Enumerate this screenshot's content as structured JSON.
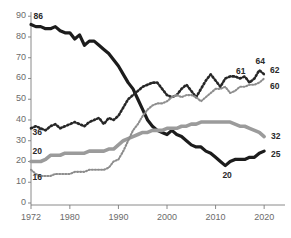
{
  "chart_data": {
    "type": "line",
    "title": "",
    "subtitle": "",
    "xlabel": "",
    "ylabel": "",
    "xlim": [
      1972,
      2021
    ],
    "ylim": [
      0,
      93
    ],
    "grid": false,
    "legend_position": "none",
    "x_ticks": [
      1972,
      1980,
      1990,
      2000,
      2010,
      2020
    ],
    "x_tick_labels": [
      "1972",
      "1980",
      "1990",
      "2000",
      "2010",
      "2020"
    ],
    "y_ticks": [
      0,
      10,
      20,
      30,
      40,
      50,
      60,
      70,
      80,
      90
    ],
    "y_tick_labels": [
      "0",
      "10",
      "20",
      "30",
      "40",
      "50",
      "60",
      "70",
      "80",
      "90"
    ],
    "series": [
      {
        "name": "series-dark-solid",
        "style": "solid",
        "color": "#1c1c1c",
        "width": 3.2,
        "start_label": "86",
        "end_label": "25",
        "annotation_label": "20",
        "x": [
          1972,
          1973,
          1974,
          1975,
          1976,
          1977,
          1978,
          1979,
          1980,
          1981,
          1982,
          1983,
          1984,
          1985,
          1986,
          1987,
          1988,
          1989,
          1990,
          1991,
          1992,
          1993,
          1994,
          1995,
          1996,
          1997,
          1998,
          1999,
          2000,
          2001,
          2002,
          2003,
          2004,
          2005,
          2006,
          2007,
          2008,
          2009,
          2010,
          2011,
          2012,
          2013,
          2014,
          2015,
          2016,
          2017,
          2018,
          2019,
          2020
        ],
        "values": [
          86,
          85,
          85,
          84,
          84,
          85,
          83,
          82,
          82,
          79,
          81,
          76,
          78,
          78,
          76,
          74,
          72,
          69,
          66,
          62,
          58,
          55,
          50,
          45,
          40,
          37,
          35,
          34,
          33,
          35,
          33,
          32,
          30,
          28,
          27,
          27,
          25,
          24,
          22,
          20,
          18,
          20,
          21,
          21,
          21,
          22,
          22,
          24,
          25
        ]
      },
      {
        "name": "series-gray-solid",
        "style": "solid",
        "color": "#9b9b9b",
        "width": 3.6,
        "start_label": "20",
        "end_label": "32",
        "x": [
          1972,
          1973,
          1974,
          1975,
          1976,
          1977,
          1978,
          1979,
          1980,
          1981,
          1982,
          1983,
          1984,
          1985,
          1986,
          1987,
          1988,
          1989,
          1990,
          1991,
          1992,
          1993,
          1994,
          1995,
          1996,
          1997,
          1998,
          1999,
          2000,
          2001,
          2002,
          2003,
          2004,
          2005,
          2006,
          2007,
          2008,
          2009,
          2010,
          2011,
          2012,
          2013,
          2014,
          2015,
          2016,
          2017,
          2018,
          2019,
          2020
        ],
        "values": [
          20,
          20,
          20,
          21,
          23,
          23,
          23,
          24,
          24,
          24,
          24,
          24,
          25,
          25,
          25,
          25,
          26,
          26,
          28,
          30,
          31,
          32,
          33,
          34,
          34,
          35,
          35,
          35,
          36,
          36,
          36,
          37,
          37,
          38,
          38,
          39,
          39,
          39,
          39,
          39,
          39,
          39,
          38,
          37,
          37,
          36,
          35,
          34,
          32
        ]
      },
      {
        "name": "series-dark-dotted",
        "style": "dotted",
        "color": "#272727",
        "width": 2.6,
        "start_label": "36",
        "end_label": "64",
        "mid_label": "61",
        "x": [
          1972,
          1973,
          1974,
          1975,
          1976,
          1977,
          1978,
          1979,
          1980,
          1981,
          1982,
          1983,
          1984,
          1985,
          1986,
          1987,
          1988,
          1989,
          1990,
          1991,
          1992,
          1993,
          1994,
          1995,
          1996,
          1997,
          1998,
          1999,
          2000,
          2001,
          2002,
          2003,
          2004,
          2005,
          2006,
          2007,
          2008,
          2009,
          2010,
          2011,
          2012,
          2013,
          2014,
          2015,
          2016,
          2017,
          2018,
          2019,
          2020
        ],
        "values": [
          36,
          37,
          36,
          35,
          37,
          38,
          36,
          37,
          38,
          39,
          38,
          37,
          39,
          40,
          41,
          38,
          41,
          40,
          42,
          46,
          50,
          52,
          54,
          56,
          57,
          58,
          58,
          55,
          52,
          51,
          52,
          55,
          57,
          54,
          51,
          55,
          59,
          62,
          59,
          56,
          60,
          61,
          61,
          60,
          61,
          58,
          60,
          64,
          62
        ]
      },
      {
        "name": "series-light-dotted",
        "style": "dotted",
        "color": "#8d8d8d",
        "width": 2.1,
        "start_label": "16",
        "end_label": "60",
        "x": [
          1972,
          1973,
          1974,
          1975,
          1976,
          1977,
          1978,
          1979,
          1980,
          1981,
          1982,
          1983,
          1984,
          1985,
          1986,
          1987,
          1988,
          1989,
          1990,
          1991,
          1992,
          1993,
          1994,
          1995,
          1996,
          1997,
          1998,
          1999,
          2000,
          2001,
          2002,
          2003,
          2004,
          2005,
          2006,
          2007,
          2008,
          2009,
          2010,
          2011,
          2012,
          2013,
          2014,
          2015,
          2016,
          2017,
          2018,
          2019,
          2020
        ],
        "values": [
          16,
          14,
          13,
          13,
          13,
          14,
          14,
          14,
          14,
          15,
          15,
          15,
          16,
          16,
          16,
          16,
          17,
          20,
          21,
          25,
          30,
          35,
          38,
          42,
          45,
          47,
          48,
          48,
          49,
          51,
          52,
          51,
          52,
          52,
          51,
          49,
          51,
          53,
          55,
          55,
          56,
          53,
          54,
          56,
          56,
          57,
          57,
          58,
          60
        ]
      }
    ],
    "point_labels": [
      {
        "text": "86",
        "x": 1972.3,
        "y": 89.5
      },
      {
        "text": "36",
        "x": 1972.1,
        "y": 33.5
      },
      {
        "text": "20",
        "x": 1972.1,
        "y": 24.5
      },
      {
        "text": "16",
        "x": 1972.1,
        "y": 12.0
      },
      {
        "text": "61",
        "x": 2014.0,
        "y": 63.0
      },
      {
        "text": "64",
        "x": 2018.0,
        "y": 68.0
      },
      {
        "text": "62",
        "x": 2021.0,
        "y": 63.5
      },
      {
        "text": "60",
        "x": 2021.0,
        "y": 56.0
      },
      {
        "text": "32",
        "x": 2021.2,
        "y": 32.0
      },
      {
        "text": "25",
        "x": 2021.2,
        "y": 23.0
      },
      {
        "text": "20",
        "x": 2011.2,
        "y": 13.0
      }
    ]
  }
}
